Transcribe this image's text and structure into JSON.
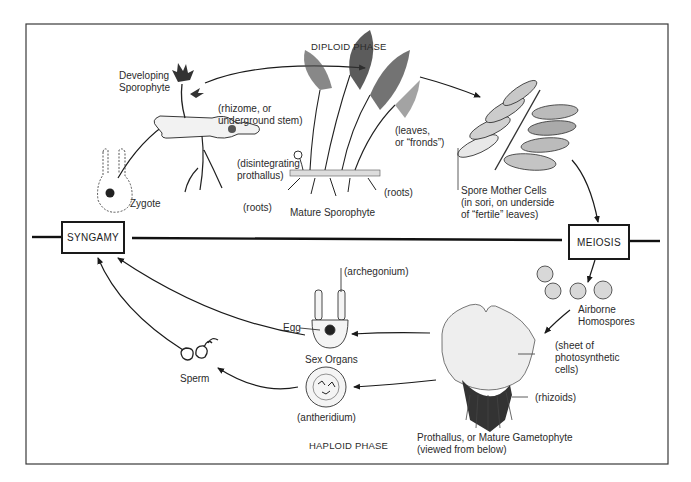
{
  "diagram": {
    "title_phases": {
      "diploid": "DIPLOID PHASE",
      "haploid": "HAPLOID PHASE"
    },
    "steps": {
      "syngamy": "SYNGAMY",
      "meiosis": "MEIOSIS"
    },
    "labels": {
      "developing_sporophyte_1": "Developing",
      "developing_sporophyte_2": "Sporophyte",
      "rhizome_1": "(rhizome, or",
      "rhizome_2": "underground stem)",
      "disintegrating_1": "(disintegrating",
      "disintegrating_2": "prothallus)",
      "roots_young": "(roots)",
      "zygote": "Zygote",
      "leaves_1": "(leaves,",
      "leaves_2": "or “fronds”)",
      "roots_mature": "(roots)",
      "mature_sporophyte": "Mature Sporophyte",
      "spore_mother_1": "Spore Mother Cells",
      "spore_mother_2": "(in sori, on underside",
      "spore_mother_3": "of “fertile” leaves)",
      "airborne_1": "Airborne",
      "airborne_2": "Homospores",
      "sheet_1": "(sheet of",
      "sheet_2": "photosynthetic",
      "sheet_3": "cells)",
      "rhizoids": "(rhizoids)",
      "prothallus_1": "Prothallus, or Mature Gametophyte",
      "prothallus_2": "(viewed from below)",
      "archegonium": "(archegonium)",
      "egg": "Egg",
      "sex_organs": "Sex Organs",
      "antheridium": "(antheridium)",
      "sperm": "Sperm"
    }
  }
}
